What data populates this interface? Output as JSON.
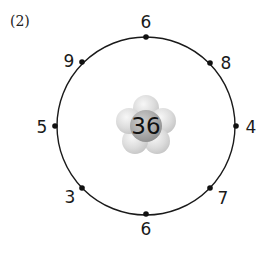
{
  "problem": {
    "label": "(2)"
  },
  "diagram": {
    "center_value": "36",
    "circle": {
      "cx": 146,
      "cy": 126,
      "r": 89
    },
    "points": [
      {
        "position": "top",
        "value": "6",
        "x": 146,
        "y": 37,
        "lx": 146,
        "ly": 28
      },
      {
        "position": "upper-right",
        "value": "8",
        "x": 210,
        "y": 63,
        "lx": 226,
        "ly": 69
      },
      {
        "position": "right",
        "value": "4",
        "x": 236,
        "y": 126,
        "lx": 251,
        "ly": 133
      },
      {
        "position": "lower-right",
        "value": "7",
        "x": 210,
        "y": 188,
        "lx": 223,
        "ly": 204
      },
      {
        "position": "bottom",
        "value": "6",
        "x": 146,
        "y": 214,
        "lx": 146,
        "ly": 235
      },
      {
        "position": "lower-left",
        "value": "3",
        "x": 82,
        "y": 188,
        "lx": 70,
        "ly": 203
      },
      {
        "position": "left",
        "value": "5",
        "x": 55,
        "y": 126,
        "lx": 42,
        "ly": 133
      },
      {
        "position": "upper-left",
        "value": "9",
        "x": 82,
        "y": 62,
        "lx": 69,
        "ly": 67
      }
    ],
    "colors": {
      "line": "#1a1a1a",
      "petal": "#d9d9d9",
      "center": "#a8a8a8"
    }
  }
}
